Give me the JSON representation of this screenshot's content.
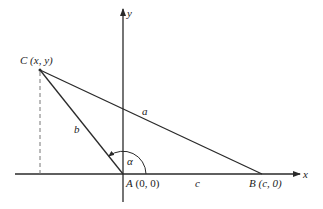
{
  "figure": {
    "axes": {
      "x_label": "x",
      "y_label": "y"
    },
    "points": {
      "C": {
        "name": "C",
        "coords": "(x, y)"
      },
      "A": {
        "name": "A",
        "coords": "(0, 0)"
      },
      "B": {
        "name": "B",
        "coords": "(c, 0)"
      }
    },
    "sides": {
      "a": "a",
      "b": "b",
      "c": "c"
    },
    "angle": {
      "label": "α"
    },
    "colors": {
      "line": "#2a2a2a",
      "dashed": "#777777",
      "background": "#ffffff"
    }
  }
}
